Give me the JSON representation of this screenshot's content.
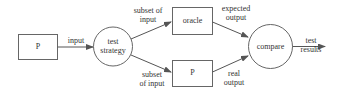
{
  "diagram": {
    "nodes": {
      "program_input": {
        "label": "P",
        "shape": "rectangle"
      },
      "test_strategy": {
        "label_line1": "test",
        "label_line2": "strategy",
        "shape": "circle"
      },
      "oracle": {
        "label": "oracle",
        "shape": "rectangle"
      },
      "program_under_test": {
        "label": "P",
        "shape": "rectangle"
      },
      "compare": {
        "label": "compare",
        "shape": "circle"
      }
    },
    "edges": {
      "input": {
        "label": "input",
        "from": "program_input",
        "to": "test_strategy"
      },
      "subset_top": {
        "label_line1": "subset of",
        "label_line2": "input",
        "from": "test_strategy",
        "to": "oracle"
      },
      "subset_bottom": {
        "label_line1": "subset",
        "label_line2": "of input",
        "from": "test_strategy",
        "to": "program_under_test"
      },
      "expected_output": {
        "label_line1": "expected",
        "label_line2": "output",
        "from": "oracle",
        "to": "compare"
      },
      "real_output": {
        "label_line1": "real",
        "label_line2": "output",
        "from": "program_under_test",
        "to": "compare"
      },
      "test_results": {
        "label_line1": "test",
        "label_line2": "results",
        "from": "compare",
        "to": "output"
      }
    },
    "colors": {
      "stroke": "#555555",
      "text": "#333333",
      "background": "#ffffff"
    }
  }
}
